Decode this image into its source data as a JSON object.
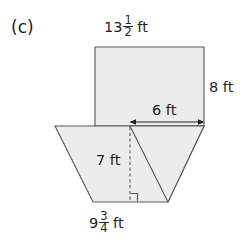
{
  "figure": {
    "part_label": "(c)",
    "colors": {
      "fill": "#ececec",
      "stroke": "#58595b",
      "text": "#231f20",
      "background": "#ffffff"
    },
    "labels": {
      "top_width": {
        "name": "rectangle-top-width",
        "whole": "13",
        "numerator": "1",
        "denominator": "2",
        "unit": "ft",
        "value_text": "13 1/2 ft"
      },
      "right_height": {
        "name": "rectangle-right-height",
        "text": "8 ft"
      },
      "upper_base": {
        "name": "trapezoid-upper-base-segment",
        "text": "6 ft"
      },
      "height": {
        "name": "trapezoid-height",
        "text": "7 ft"
      },
      "bottom_width": {
        "name": "trapezoid-bottom-width",
        "whole": "9",
        "numerator": "3",
        "denominator": "4",
        "unit": "ft",
        "value_text": "9 3/4 ft"
      }
    },
    "shapes": {
      "rectangle": {
        "name": "rectangle-shape",
        "points": "95,47 204,47 204,126 95,126"
      },
      "trapezoid": {
        "name": "trapezoid-shape",
        "points": "55,126 204,126 168,202 93,202"
      },
      "triangle": {
        "name": "triangle-shape",
        "points": "130,126 204,126 168,202"
      }
    },
    "annotations": {
      "dashed_height_line": {
        "name": "dashed-height-line",
        "x": 130,
        "y1": 127,
        "y2": 201
      },
      "right_angle_marker": {
        "name": "right-angle-marker",
        "points": "130,193 138,193 138,201"
      },
      "dimension_arrow": {
        "name": "six-ft-dimension-arrow",
        "x1": 130,
        "x2": 204,
        "y": 122
      }
    }
  }
}
